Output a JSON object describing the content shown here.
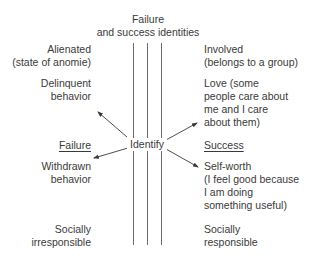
{
  "title": {
    "line1": "Failure",
    "line2": "and success identities"
  },
  "center_label": "Identify",
  "failure_column": {
    "heading": "Failure",
    "items": [
      {
        "lines": [
          "Alienated",
          "(state of anomie)"
        ]
      },
      {
        "lines": [
          "Delinquent",
          "behavior"
        ]
      },
      {
        "lines": [
          "Withdrawn",
          "behavior"
        ]
      },
      {
        "lines": [
          "Socially",
          "irresponsible"
        ]
      }
    ]
  },
  "success_column": {
    "heading": "Success",
    "items": [
      {
        "lines": [
          "Involved",
          "(belongs to a group)"
        ]
      },
      {
        "lines": [
          "Love (some",
          "people care about",
          "me and I care",
          "about them)"
        ]
      },
      {
        "lines": [
          "Self-worth",
          "(I feel good because",
          "I am doing",
          "something useful)"
        ]
      },
      {
        "lines": [
          "Socially",
          "responsible"
        ]
      }
    ]
  },
  "colors": {
    "text": "#3a3a3a",
    "lines": "#6a6a6a",
    "background": "#ffffff"
  }
}
